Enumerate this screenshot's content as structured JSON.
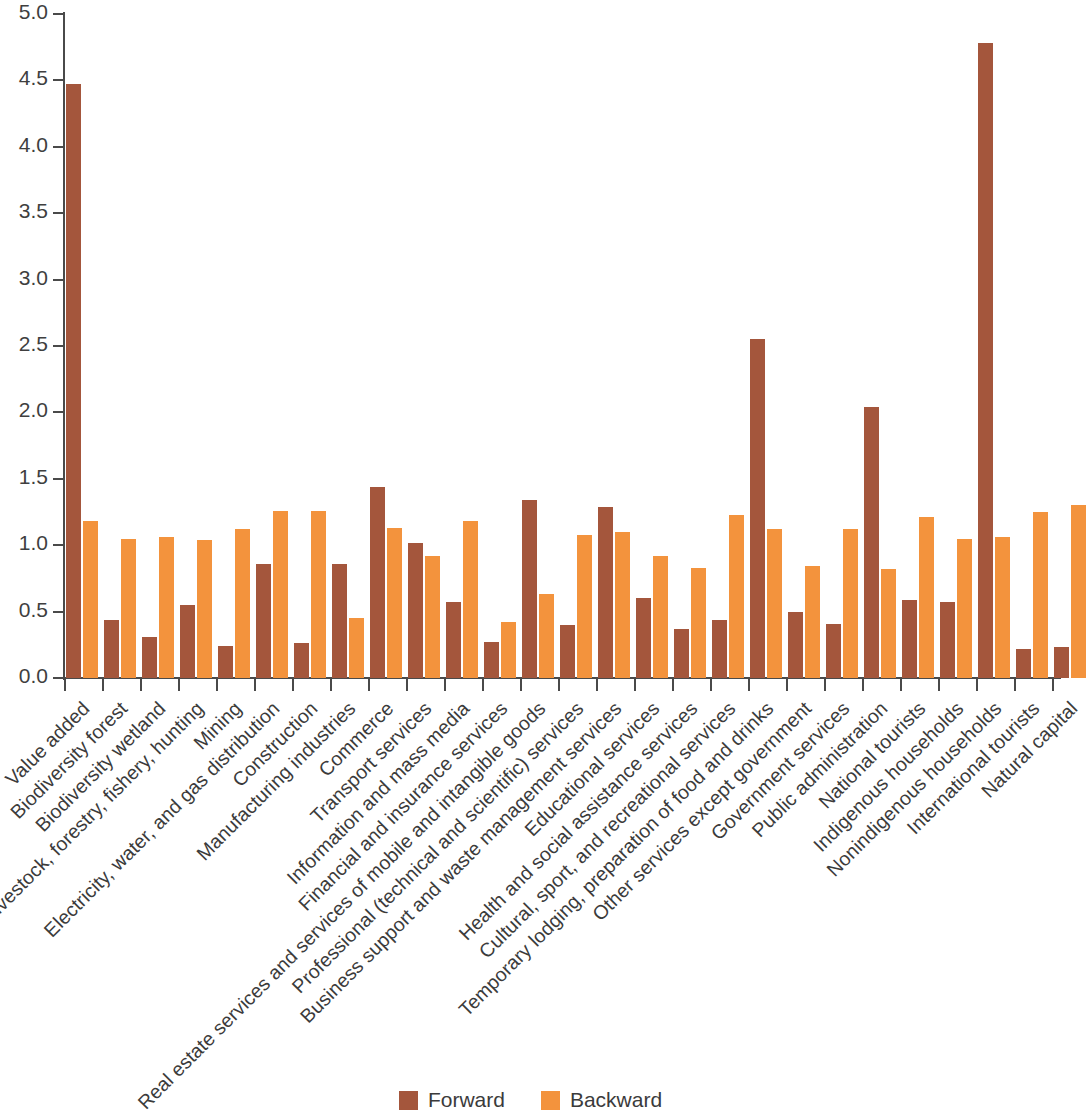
{
  "chart_data": {
    "type": "bar",
    "title": "",
    "subtitle": "",
    "xlabel": "",
    "ylabel": "",
    "ylim": [
      0.0,
      5.0
    ],
    "ytick_labels": [
      "0.0",
      "0.5",
      "1.0",
      "1.5",
      "2.0",
      "2.5",
      "3.0",
      "3.5",
      "4.0",
      "4.5",
      "5.0"
    ],
    "ytick_values": [
      0.0,
      0.5,
      1.0,
      1.5,
      2.0,
      2.5,
      3.0,
      3.5,
      4.0,
      4.5,
      5.0
    ],
    "grid": false,
    "legend_position": "bottom-center",
    "categories": [
      "Value added",
      "Biodiversity forest",
      "Biodiversity wetland",
      "Livestock, forestry, fishery, hunting",
      "Mining",
      "Electricity, water, and gas distribution",
      "Construction",
      "Manufacturing industries",
      "Commerce",
      "Transport services",
      "Information and mass media",
      "Financial and insurance services",
      "Real estate services and services of mobile and intangible goods",
      "Professional (technical and scientific) services",
      "Business support and waste management services",
      "Educational services",
      "Health and social assistance services",
      "Cultural, sport, and recreational services",
      "Temporary lodging, preparation of food and drinks",
      "Other services except government",
      "Government services",
      "Public administration",
      "National tourists",
      "Indigenous households",
      "Nonindigenous households",
      "International tourists",
      "Natural capital"
    ],
    "series": [
      {
        "name": "Forward",
        "color": "#a4563c",
        "values": [
          4.47,
          0.44,
          0.31,
          0.55,
          0.24,
          0.86,
          0.26,
          0.86,
          1.44,
          1.02,
          0.57,
          0.27,
          1.34,
          0.4,
          1.29,
          0.6,
          0.37,
          0.44,
          2.55,
          0.5,
          0.41,
          2.04,
          0.59,
          0.57,
          4.78,
          0.22,
          0.23
        ]
      },
      {
        "name": "Backward",
        "color": "#f3933d",
        "values": [
          1.18,
          1.05,
          1.06,
          1.04,
          1.12,
          1.26,
          1.26,
          0.45,
          1.13,
          0.92,
          1.18,
          0.42,
          0.63,
          1.08,
          1.1,
          0.92,
          0.83,
          1.23,
          1.12,
          0.84,
          1.12,
          0.82,
          1.21,
          1.05,
          1.06,
          1.25,
          1.3
        ]
      }
    ]
  },
  "legend": {
    "items": [
      {
        "label": "Forward",
        "color": "#a4563c"
      },
      {
        "label": "Backward",
        "color": "#f3933d"
      }
    ]
  }
}
